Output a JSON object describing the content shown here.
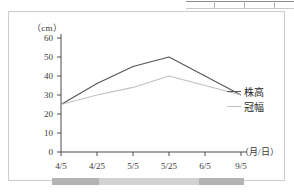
{
  "figure": {
    "y_unit_label": "（cm）",
    "x_axis_title": "（月/日）"
  },
  "legend": {
    "entries": [
      {
        "label": "株高",
        "color": "#555555"
      },
      {
        "label": "冠幅",
        "color": "#c0c0c0"
      }
    ]
  },
  "annotation": {
    "bar_present": true,
    "bar_color": "#b3b3b3"
  },
  "chart_data": {
    "type": "line",
    "title": "",
    "xlabel": "（月/日）",
    "ylabel": "（cm）",
    "categories": [
      "4/5",
      "4/25",
      "5/5",
      "5/25",
      "6/5",
      "9/5"
    ],
    "ylim": [
      0,
      60
    ],
    "yticks": [
      0,
      10,
      20,
      30,
      40,
      50,
      60
    ],
    "grid": false,
    "legend_position": "right",
    "series": [
      {
        "name": "株高",
        "color": "#555555",
        "values": [
          25,
          36,
          45,
          50,
          40,
          30
        ]
      },
      {
        "name": "冠幅",
        "color": "#c0c0c0",
        "values": [
          25,
          30,
          34,
          40,
          35,
          30
        ]
      }
    ]
  }
}
